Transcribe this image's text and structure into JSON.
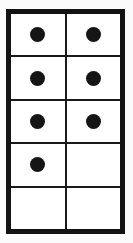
{
  "figure": {
    "frame": {
      "border_color": "#131313",
      "border_width_px": 5,
      "inner_line_color": "#1a1a1a",
      "inner_line_width_px": 2,
      "background_color": "#ffffff"
    },
    "page_background_color": "#fbfbfb",
    "dot_color": "#151515",
    "columns": 2,
    "rows": 5,
    "total_dots": 7
  },
  "chart_data": {
    "type": "table",
    "columns": [
      "left",
      "right"
    ],
    "rows": [
      {
        "left": 1,
        "right": 1
      },
      {
        "left": 1,
        "right": 1
      },
      {
        "left": 1,
        "right": 1
      },
      {
        "left": 1,
        "right": 0
      },
      {
        "left": 0,
        "right": 0
      }
    ],
    "column_totals": [
      4,
      3
    ],
    "total": 7,
    "legend": "1 = filled dot, 0 = empty cell"
  },
  "cells": [
    {
      "row": 1,
      "col": "left",
      "filled": true
    },
    {
      "row": 1,
      "col": "right",
      "filled": true
    },
    {
      "row": 2,
      "col": "left",
      "filled": true
    },
    {
      "row": 2,
      "col": "right",
      "filled": true
    },
    {
      "row": 3,
      "col": "left",
      "filled": true
    },
    {
      "row": 3,
      "col": "right",
      "filled": true
    },
    {
      "row": 4,
      "col": "left",
      "filled": true
    },
    {
      "row": 4,
      "col": "right",
      "filled": false
    },
    {
      "row": 5,
      "col": "left",
      "filled": false
    },
    {
      "row": 5,
      "col": "right",
      "filled": false
    }
  ]
}
